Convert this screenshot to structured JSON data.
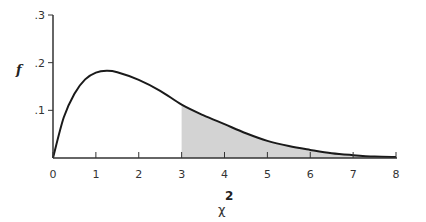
{
  "chart_data": {
    "type": "area",
    "title": "",
    "xlabel": "χ",
    "xlabel_superscript": "2",
    "ylabel": "f",
    "xlim": [
      0,
      8
    ],
    "ylim": [
      0,
      0.3
    ],
    "x_ticks": [
      "0",
      "1",
      "2",
      "3",
      "4",
      "5",
      "6",
      "7",
      "8"
    ],
    "y_ticks": [
      ".1",
      ".2",
      ".3"
    ],
    "grid": false,
    "legend": null,
    "series": [
      {
        "name": "density",
        "x": [
          0,
          0.25,
          0.5,
          0.75,
          1.0,
          1.25,
          1.5,
          2.0,
          2.5,
          3.0,
          3.5,
          4.0,
          4.5,
          5.0,
          5.5,
          6.0,
          6.5,
          7.0,
          7.5,
          8.0
        ],
        "values": [
          0.0,
          0.085,
          0.135,
          0.165,
          0.179,
          0.183,
          0.18,
          0.164,
          0.141,
          0.112,
          0.09,
          0.071,
          0.052,
          0.036,
          0.025,
          0.017,
          0.01,
          0.006,
          0.003,
          0.002
        ]
      }
    ],
    "shaded_region": {
      "from": 3,
      "to": 8,
      "color": "#d3d3d3"
    },
    "colors": {
      "curve": "#1a1a1a",
      "axis": "#333333",
      "shade": "#d3d3d3"
    }
  }
}
